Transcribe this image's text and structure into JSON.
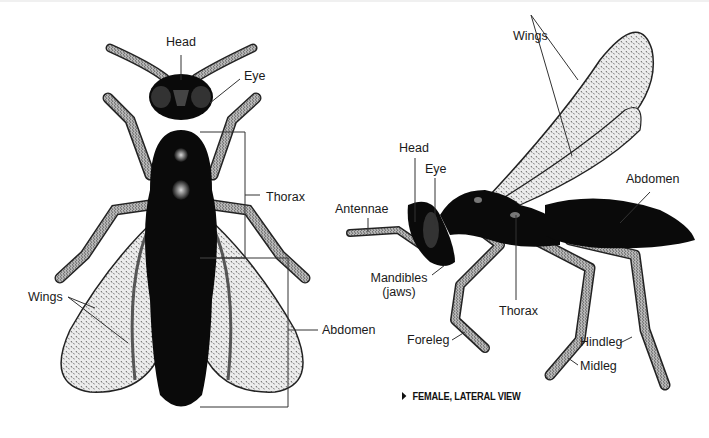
{
  "figure": {
    "dorsal_view": {
      "labels": {
        "head": "Head",
        "eye": "Eye",
        "thorax": "Thorax",
        "wings": "Wings",
        "abdomen": "Abdomen"
      }
    },
    "lateral_view": {
      "labels": {
        "wings": "Wings",
        "head": "Head",
        "eye": "Eye",
        "antennae": "Antennae",
        "abdomen": "Abdomen",
        "mandibles": "Mandibles",
        "mandibles_sub": "(jaws)",
        "thorax": "Thorax",
        "foreleg": "Foreleg",
        "hindleg": "Hindleg",
        "midleg": "Midleg"
      },
      "caption": "FEMALE, LATERAL VIEW"
    },
    "colors": {
      "background": "#ffffff",
      "body": "#0a0a0a",
      "wing_fill": "#e6e6e6",
      "leg_fill": "#bdbdbd",
      "leader_line": "#333333",
      "text": "#1a1a1a"
    }
  }
}
